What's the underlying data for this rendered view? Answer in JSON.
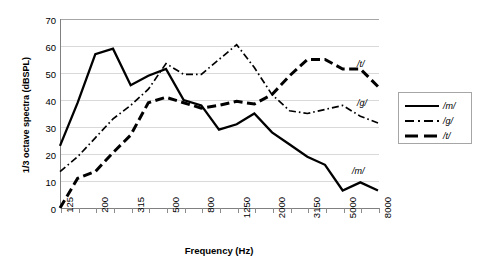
{
  "chart_data": {
    "type": "line",
    "title": "",
    "xlabel": "Frequency (Hz)",
    "ylabel": "1/3 octave spectra (dBSPL)",
    "ylim": [
      0,
      70
    ],
    "ytick_labels": [
      "70",
      "60",
      "50",
      "40",
      "30",
      "20",
      "10",
      "0"
    ],
    "ytick_values": [
      70,
      60,
      50,
      40,
      30,
      20,
      10,
      0
    ],
    "grid": true,
    "legend_position": "right-outside",
    "x": [
      125,
      160,
      200,
      250,
      315,
      400,
      500,
      630,
      800,
      1000,
      1250,
      1600,
      2000,
      2500,
      3150,
      4000,
      5000,
      6300,
      8000
    ],
    "xtick_labels": [
      "125",
      "",
      "200",
      "",
      "315",
      "",
      "500",
      "",
      "800",
      "",
      "1250",
      "",
      "2000",
      "",
      "3150",
      "",
      "5000",
      "",
      "8000"
    ],
    "xtick_labels_shown": [
      "125",
      "200",
      "315",
      "500",
      "800",
      "1250",
      "2000",
      "3150",
      "5000",
      "8000"
    ],
    "series": [
      {
        "name": "/m/",
        "style": "solid",
        "color": "#000000",
        "values": [
          23,
          39,
          57,
          59,
          45.5,
          49,
          51.5,
          40,
          38,
          29,
          31,
          35,
          28,
          23.5,
          19,
          16,
          6.5,
          9.5,
          6.5
        ]
      },
      {
        "name": "/g/",
        "style": "dash-dot",
        "color": "#000000",
        "values": [
          13.5,
          19,
          26,
          33,
          38,
          44,
          53.5,
          49.5,
          49.5,
          55,
          60.5,
          52,
          42,
          36,
          35,
          36.5,
          38,
          34,
          31.5
        ]
      },
      {
        "name": "/t/",
        "style": "dashed",
        "color": "#000000",
        "values": [
          0,
          11,
          13.5,
          20.5,
          27,
          39,
          41,
          39,
          37,
          38,
          39.5,
          38.5,
          42,
          49,
          55,
          55,
          51.5,
          51.5,
          45
        ]
      }
    ],
    "annotations": [
      {
        "text": "/t/",
        "x_px": 357,
        "y_px": 59
      },
      {
        "text": "/g/",
        "x_px": 357,
        "y_px": 98
      },
      {
        "text": "/m/",
        "x_px": 352,
        "y_px": 166
      }
    ]
  },
  "legend": {
    "items": [
      {
        "label": "/m/",
        "style": "solid"
      },
      {
        "label": "/g/",
        "style": "dash-dot"
      },
      {
        "label": "/t/",
        "style": "dashed"
      }
    ]
  }
}
